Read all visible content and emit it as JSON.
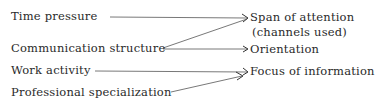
{
  "diagram": {
    "type": "influence-diagram",
    "sources": [
      {
        "id": "time_pressure",
        "label": "Time pressure"
      },
      {
        "id": "communication_structure",
        "label": "Communication structure"
      },
      {
        "id": "work_activity",
        "label": "Work activity"
      },
      {
        "id": "professional_specialization",
        "label": "Professional specialization"
      }
    ],
    "targets": [
      {
        "id": "span_of_attention",
        "label": "Span of attention",
        "sublabel": "(channels used)"
      },
      {
        "id": "orientation",
        "label": "Orientation"
      },
      {
        "id": "focus_of_information",
        "label": "Focus of information"
      }
    ],
    "edges": [
      {
        "from": "time_pressure",
        "to": "span_of_attention"
      },
      {
        "from": "communication_structure",
        "to": "span_of_attention"
      },
      {
        "from": "communication_structure",
        "to": "orientation"
      },
      {
        "from": "work_activity",
        "to": "focus_of_information"
      },
      {
        "from": "professional_specialization",
        "to": "focus_of_information"
      }
    ]
  }
}
